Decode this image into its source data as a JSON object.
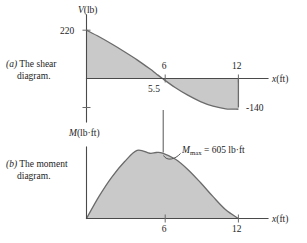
{
  "figure": {
    "captions": [
      {
        "id": "a",
        "marker": "(a)",
        "line1": "The shear",
        "line2": "diagram."
      },
      {
        "id": "b",
        "marker": "(b)",
        "line1": "The moment",
        "line2": "diagram."
      }
    ]
  },
  "chart_data": [
    {
      "type": "line",
      "title": "The shear diagram.",
      "panel": "a",
      "ylabel": "V(lb)",
      "xlabel": "x(ft)",
      "y_axis_label_var": "V",
      "y_axis_label_unit": "(lb)",
      "x_axis_label_var": "x",
      "x_axis_label_unit": "(ft)",
      "xlim": [
        0,
        13.6
      ],
      "ylim": [
        -160,
        240
      ],
      "xticks": [
        6,
        12
      ],
      "xtick_labels": [
        "6",
        "12"
      ],
      "yticks": [
        220,
        -140
      ],
      "ytick_labels": [
        "220",
        "-140"
      ],
      "zero_crossing_label": "5.5",
      "zero_crossing_x": 5.5,
      "grid": false,
      "legend": null,
      "x": [
        0,
        1,
        2,
        3,
        4,
        5,
        5.5,
        6,
        7,
        8,
        9,
        10,
        11,
        12
      ],
      "values": [
        220,
        190,
        157,
        122,
        85,
        44,
        22,
        0,
        -41,
        -76,
        -105,
        -126,
        -138,
        -140
      ],
      "annotations": [
        {
          "text": "220",
          "x": 0,
          "y": 220
        },
        {
          "text": "5.5",
          "x": 5.5,
          "y": 0
        },
        {
          "text": "6",
          "x": 6,
          "y": 0
        },
        {
          "text": "12",
          "x": 12,
          "y": 0
        },
        {
          "text": "-140",
          "x": 12,
          "y": -140
        }
      ]
    },
    {
      "type": "area",
      "title": "The moment diagram.",
      "panel": "b",
      "ylabel": "M(lb·ft)",
      "xlabel": "x(ft)",
      "y_axis_label_var": "M",
      "y_axis_label_unit": "(lb·ft)",
      "x_axis_label_var": "x",
      "x_axis_label_unit": "(ft)",
      "xlim": [
        0,
        13.6
      ],
      "ylim": [
        0,
        700
      ],
      "xticks": [
        6,
        12
      ],
      "xtick_labels": [
        "6",
        "12"
      ],
      "grid": false,
      "legend": null,
      "x": [
        0,
        1,
        2,
        3,
        4,
        5,
        5.5,
        6,
        7,
        8,
        9,
        10,
        11,
        12
      ],
      "values": [
        0,
        205,
        380,
        520,
        625,
        598,
        605,
        600,
        545,
        450,
        330,
        200,
        80,
        0
      ],
      "annotations": [
        {
          "text": "Mmax = 605 lb·ft",
          "symbol": "M",
          "subscript": "max",
          "equals": "=",
          "value": "605 lb·ft",
          "x": 5.5,
          "y": 605
        }
      ]
    }
  ],
  "colors": {
    "fill": "#c9c9c9",
    "stroke": "#6b6b6b",
    "axis": "#4a4a4a",
    "text": "#1d1d1d",
    "background": "#ffffff"
  }
}
